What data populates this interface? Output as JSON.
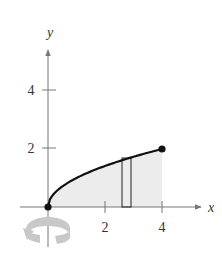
{
  "diagram": {
    "axes": {
      "x_label": "x",
      "y_label": "y",
      "x_ticks": [
        {
          "value": 2,
          "label": "2"
        },
        {
          "value": 4,
          "label": "4"
        }
      ],
      "y_ticks": [
        {
          "value": 2,
          "label": "2"
        },
        {
          "value": 4,
          "label": "4"
        }
      ]
    },
    "curve": {
      "function": "y = sqrt(x)",
      "x_start": 0,
      "x_end": 4,
      "endpoints": [
        [
          0,
          0
        ],
        [
          4,
          2
        ]
      ]
    },
    "region": {
      "x_from": 0,
      "x_to": 4,
      "fill": "#ececec"
    },
    "representative_rectangle": {
      "x_left": 2.6,
      "x_right": 2.9
    },
    "rotation_indicator": {
      "axis": "y-axis",
      "color": "#c8c8c8"
    },
    "colors": {
      "axis": "#777777",
      "curve": "#111111",
      "region": "#ececec",
      "rotation_arrow": "#c8c8c8"
    }
  },
  "chart_data": {
    "type": "area",
    "title": "",
    "xlabel": "x",
    "ylabel": "y",
    "x": [
      0,
      0.5,
      1,
      1.5,
      2,
      2.5,
      3,
      3.5,
      4
    ],
    "series": [
      {
        "name": "y = sqrt(x)",
        "values": [
          0,
          0.707,
          1,
          1.225,
          1.414,
          1.581,
          1.732,
          1.871,
          2
        ]
      }
    ],
    "xlim": [
      -1.5,
      5.3
    ],
    "ylim": [
      -1.8,
      5.5
    ],
    "grid": false,
    "annotations": [
      "filled endpoints at (0,0) and (4,2)",
      "representative rectangle near x≈2.75",
      "rotation arrow around y-axis"
    ]
  }
}
